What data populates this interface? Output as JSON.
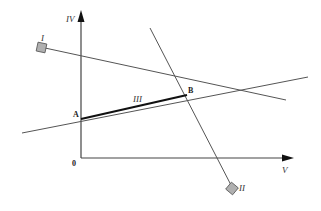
{
  "diagram": {
    "colors": {
      "line": "#555555",
      "axis": "#444444",
      "segment": "#111111",
      "marker_fill": "#b0b0b0",
      "marker_stroke": "#555555"
    },
    "axes": {
      "vertical_label": "IV",
      "horizontal_label": "V",
      "origin_label": "0"
    },
    "lines": [
      {
        "id": "I",
        "label": "I"
      },
      {
        "id": "II",
        "label": "II"
      }
    ],
    "segment": {
      "label": "III",
      "start_label": "A",
      "end_label": "B"
    }
  }
}
